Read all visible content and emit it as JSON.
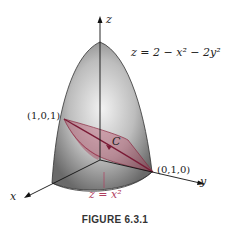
{
  "figure": {
    "caption": "FIGURE 6.3.1",
    "surface_equation": "z = 2 − x² − 2y²",
    "cylinder_equation": "z = x²",
    "curve_label": "C",
    "axes": {
      "x": "x",
      "y": "y",
      "z": "z"
    },
    "points": {
      "p1": "(1,0,1)",
      "p2": "(0,1,0)"
    },
    "colors": {
      "surface": "#8a8a8a",
      "cylinder": "#b03050",
      "axis": "#111111"
    }
  }
}
